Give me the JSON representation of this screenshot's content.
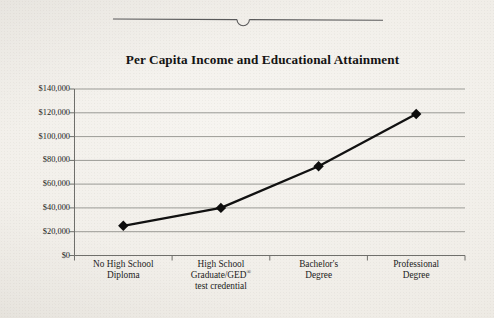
{
  "page": {
    "background_color": "#efece6",
    "top_rule": {
      "name": "page-edge-rule",
      "notch_shape": "semicircle"
    }
  },
  "chart_data": {
    "type": "line",
    "title": "Per Capita Income and Educational Attainment",
    "xlabel": "",
    "ylabel": "",
    "categories": [
      "No High School Diploma",
      "High School Graduate/GED® test credential",
      "Bachelor's Degree",
      "Professional Degree"
    ],
    "category_lines": [
      [
        "No High School",
        "Diploma"
      ],
      [
        "High School",
        "Graduate/GED®",
        "test credential"
      ],
      [
        "Bachelor's",
        "Degree"
      ],
      [
        "Professional",
        "Degree"
      ]
    ],
    "values": [
      25000,
      40000,
      75000,
      119000
    ],
    "ylim": [
      0,
      140000
    ],
    "ytick_values": [
      0,
      20000,
      40000,
      60000,
      80000,
      100000,
      120000,
      140000
    ],
    "ytick_labels": [
      "$0",
      "$20,000",
      "$40,000",
      "$60,000",
      "$80,000",
      "$100,000",
      "$120,000",
      "$140,000"
    ],
    "grid": true,
    "grid_axis": "y",
    "legend": false,
    "legend_position": "none",
    "series": [
      {
        "name": "Per Capita Income",
        "values": [
          25000,
          40000,
          75000,
          119000
        ],
        "line_color": "#111111",
        "marker": "diamond",
        "marker_color": "#0d0d0d"
      }
    ],
    "colors": {
      "line": "#111111",
      "marker": "#0d0d0d",
      "grid": "#9b9b96",
      "axis": "#6f6f6b",
      "text": "#1c1c1c",
      "background": "#efece6"
    }
  },
  "footnote_symbol": "®"
}
